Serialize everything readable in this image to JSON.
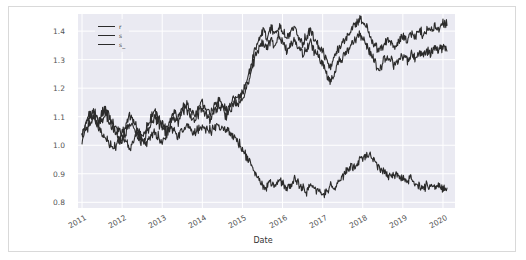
{
  "figure": {
    "style": "seaborn-darkgrid",
    "plot_bg": "#eaeaf2",
    "page_bg": "#ffffff",
    "grid_color": "#ffffff",
    "frame_color": "#d9d9d9",
    "line_color": "#2b2b2b"
  },
  "legend": {
    "position": "upper-left",
    "entries": [
      {
        "label": "r",
        "color": "#2b2b2b"
      },
      {
        "label": "s",
        "color": "#2b2b2b"
      },
      {
        "label": "s_",
        "color": "#2b2b2b"
      }
    ]
  },
  "chart_data": {
    "type": "line",
    "title": "",
    "xlabel": "Date",
    "ylabel": "",
    "grid": true,
    "legend_position": "upper-left",
    "xlim": [
      2010.9,
      2020.3
    ],
    "ylim": [
      0.78,
      1.46
    ],
    "xticks": [
      "2011",
      "2012",
      "2013",
      "2014",
      "2015",
      "2016",
      "2017",
      "2018",
      "2019",
      "2020"
    ],
    "yticks": [
      0.8,
      0.9,
      1.0,
      1.1,
      1.2,
      1.3,
      1.4
    ],
    "x": [
      2011.0,
      2011.1,
      2011.2,
      2011.3,
      2011.4,
      2011.5,
      2011.6,
      2011.7,
      2011.8,
      2011.9,
      2012.0,
      2012.1,
      2012.2,
      2012.3,
      2012.4,
      2012.5,
      2012.6,
      2012.7,
      2012.8,
      2012.9,
      2013.0,
      2013.1,
      2013.2,
      2013.3,
      2013.4,
      2013.5,
      2013.6,
      2013.7,
      2013.8,
      2013.9,
      2014.0,
      2014.1,
      2014.2,
      2014.3,
      2014.4,
      2014.5,
      2014.6,
      2014.7,
      2014.8,
      2014.9,
      2015.0,
      2015.1,
      2015.2,
      2015.3,
      2015.4,
      2015.5,
      2015.6,
      2015.7,
      2015.8,
      2015.9,
      2016.0,
      2016.1,
      2016.2,
      2016.3,
      2016.4,
      2016.5,
      2016.6,
      2016.7,
      2016.8,
      2016.9,
      2017.0,
      2017.1,
      2017.2,
      2017.3,
      2017.4,
      2017.5,
      2017.6,
      2017.7,
      2017.8,
      2017.9,
      2018.0,
      2018.1,
      2018.2,
      2018.3,
      2018.4,
      2018.5,
      2018.6,
      2018.7,
      2018.8,
      2018.9,
      2019.0,
      2019.1,
      2019.2,
      2019.3,
      2019.4,
      2019.5,
      2019.6,
      2019.7,
      2019.8,
      2019.9,
      2020.0,
      2020.1
    ],
    "series": [
      {
        "name": "r",
        "color": "#2b2b2b",
        "values": [
          1.03,
          1.07,
          1.1,
          1.12,
          1.09,
          1.11,
          1.13,
          1.1,
          1.07,
          1.05,
          1.04,
          1.07,
          1.1,
          1.08,
          1.05,
          1.03,
          1.06,
          1.09,
          1.12,
          1.1,
          1.08,
          1.06,
          1.09,
          1.12,
          1.1,
          1.13,
          1.15,
          1.12,
          1.1,
          1.13,
          1.15,
          1.13,
          1.11,
          1.14,
          1.16,
          1.14,
          1.12,
          1.15,
          1.17,
          1.16,
          1.18,
          1.22,
          1.27,
          1.33,
          1.37,
          1.4,
          1.38,
          1.41,
          1.39,
          1.42,
          1.4,
          1.37,
          1.39,
          1.41,
          1.38,
          1.36,
          1.38,
          1.4,
          1.37,
          1.35,
          1.33,
          1.3,
          1.27,
          1.31,
          1.34,
          1.36,
          1.38,
          1.4,
          1.42,
          1.44,
          1.43,
          1.41,
          1.38,
          1.35,
          1.33,
          1.35,
          1.37,
          1.36,
          1.34,
          1.36,
          1.38,
          1.37,
          1.39,
          1.38,
          1.4,
          1.39,
          1.41,
          1.4,
          1.42,
          1.41,
          1.43,
          1.42
        ]
      },
      {
        "name": "s",
        "color": "#2b2b2b",
        "values": [
          1.01,
          1.05,
          1.08,
          1.1,
          1.07,
          1.09,
          1.11,
          1.08,
          1.05,
          1.03,
          1.02,
          1.05,
          1.08,
          1.06,
          1.03,
          1.01,
          1.04,
          1.07,
          1.1,
          1.08,
          1.06,
          1.04,
          1.07,
          1.1,
          1.08,
          1.11,
          1.13,
          1.1,
          1.08,
          1.11,
          1.13,
          1.11,
          1.09,
          1.12,
          1.14,
          1.12,
          1.1,
          1.13,
          1.15,
          1.14,
          1.16,
          1.2,
          1.25,
          1.3,
          1.34,
          1.36,
          1.34,
          1.37,
          1.35,
          1.38,
          1.36,
          1.33,
          1.35,
          1.37,
          1.34,
          1.32,
          1.34,
          1.36,
          1.33,
          1.31,
          1.29,
          1.25,
          1.22,
          1.26,
          1.29,
          1.31,
          1.33,
          1.35,
          1.37,
          1.39,
          1.38,
          1.35,
          1.32,
          1.29,
          1.27,
          1.29,
          1.31,
          1.3,
          1.28,
          1.3,
          1.31,
          1.3,
          1.32,
          1.31,
          1.32,
          1.31,
          1.33,
          1.32,
          1.34,
          1.33,
          1.34,
          1.33
        ]
      },
      {
        "name": "s_",
        "color": "#2b2b2b",
        "values": [
          1.04,
          1.08,
          1.11,
          1.09,
          1.06,
          1.04,
          1.02,
          1.0,
          0.99,
          1.01,
          1.03,
          1.01,
          0.99,
          1.02,
          1.04,
          1.02,
          1.0,
          1.03,
          1.05,
          1.03,
          1.01,
          1.04,
          1.06,
          1.05,
          1.03,
          1.05,
          1.07,
          1.06,
          1.04,
          1.06,
          1.07,
          1.06,
          1.05,
          1.06,
          1.07,
          1.06,
          1.05,
          1.04,
          1.03,
          1.01,
          0.99,
          0.96,
          0.93,
          0.9,
          0.88,
          0.86,
          0.85,
          0.87,
          0.86,
          0.88,
          0.87,
          0.85,
          0.86,
          0.88,
          0.87,
          0.85,
          0.84,
          0.86,
          0.85,
          0.84,
          0.83,
          0.84,
          0.86,
          0.85,
          0.87,
          0.89,
          0.91,
          0.93,
          0.92,
          0.94,
          0.96,
          0.97,
          0.96,
          0.94,
          0.92,
          0.91,
          0.9,
          0.89,
          0.9,
          0.89,
          0.88,
          0.87,
          0.88,
          0.87,
          0.86,
          0.85,
          0.86,
          0.85,
          0.85,
          0.86,
          0.85,
          0.85
        ]
      }
    ]
  }
}
